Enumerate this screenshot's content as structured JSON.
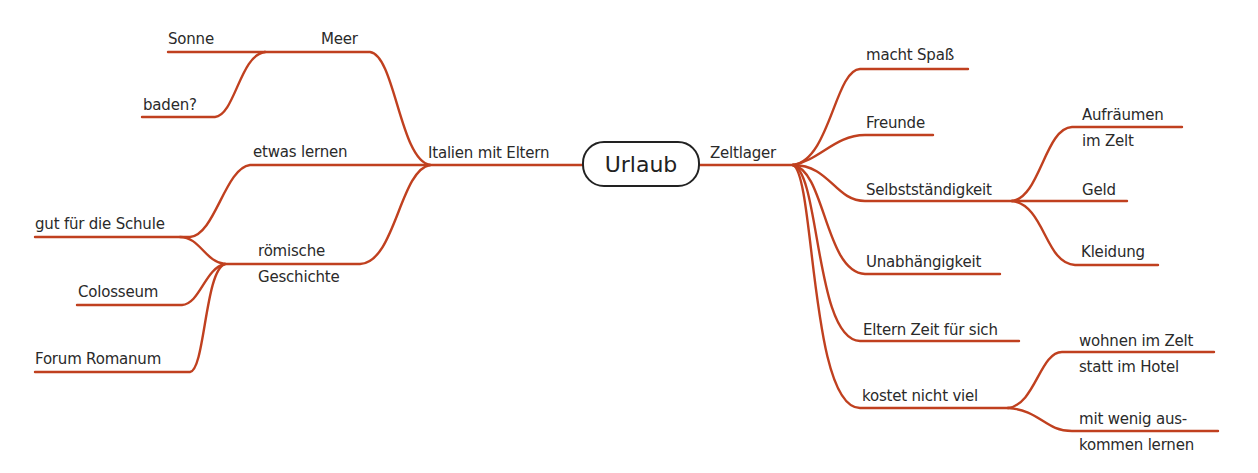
{
  "center": {
    "label": "Urlaub"
  },
  "colors": {
    "branch": "#c0401f",
    "text": "#2a2a2a",
    "center_border": "#222222"
  },
  "left": {
    "main": {
      "label": "Italien mit Eltern"
    },
    "branches": [
      {
        "label": "Meer",
        "children": [
          {
            "label": "Sonne"
          },
          {
            "label": "baden?"
          }
        ]
      },
      {
        "label": "etwas lernen",
        "children": []
      },
      {
        "label_line1": "römische",
        "label_line2": "Geschichte",
        "children": [
          {
            "label": "gut für die Schule"
          },
          {
            "label": "Colosseum"
          },
          {
            "label": "Forum Romanum"
          }
        ]
      }
    ]
  },
  "right": {
    "main": {
      "label": "Zeltlager"
    },
    "branches": [
      {
        "label": "macht Spaß"
      },
      {
        "label": "Freunde"
      },
      {
        "label": "Selbstständigkeit",
        "children": [
          {
            "label_line1": "Aufräumen",
            "label_line2": "im Zelt"
          },
          {
            "label": "Geld"
          },
          {
            "label": "Kleidung"
          }
        ]
      },
      {
        "label": "Unabhängigkeit"
      },
      {
        "label": "Eltern Zeit für sich"
      },
      {
        "label": "kostet nicht viel",
        "children": [
          {
            "label_line1": "wohnen im Zelt",
            "label_line2": "statt im Hotel"
          },
          {
            "label_line1": "mit wenig aus-",
            "label_line2": "kommen lernen"
          }
        ]
      }
    ]
  }
}
